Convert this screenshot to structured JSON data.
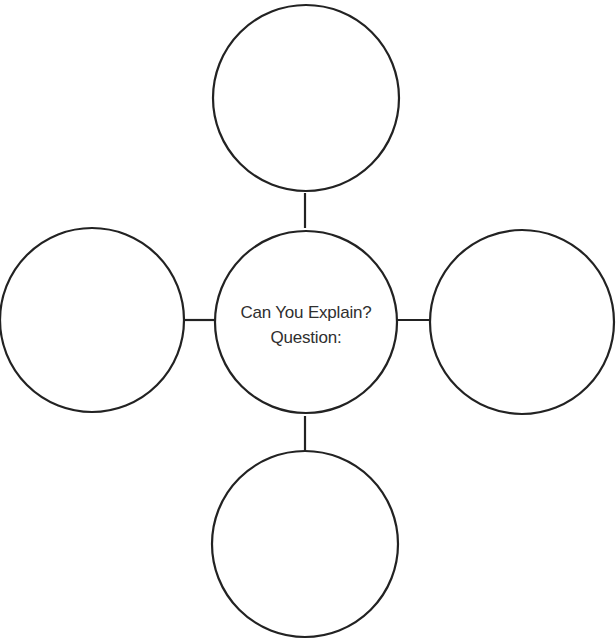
{
  "diagram": {
    "type": "spider-map",
    "center": {
      "title": "Can You Explain?",
      "subtitle": "Question:"
    },
    "branches": [
      {
        "position": "top",
        "text": ""
      },
      {
        "position": "left",
        "text": ""
      },
      {
        "position": "right",
        "text": ""
      },
      {
        "position": "bottom",
        "text": ""
      }
    ],
    "colors": {
      "stroke": "#222222",
      "text": "#2f2f2f",
      "background": "#ffffff"
    }
  }
}
